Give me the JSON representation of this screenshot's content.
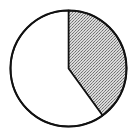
{
  "chart_data": {
    "type": "pie",
    "title": "",
    "start_angle_deg": 0,
    "direction": "clockwise",
    "slices": [
      {
        "label": "",
        "value": 40,
        "fill": "#bdbdbd",
        "pattern": "stipple"
      },
      {
        "label": "",
        "value": 60,
        "fill": "#ffffff",
        "pattern": "none"
      }
    ],
    "center": [
      68.5,
      68.5
    ],
    "radius": 58,
    "stroke": "#111111"
  }
}
